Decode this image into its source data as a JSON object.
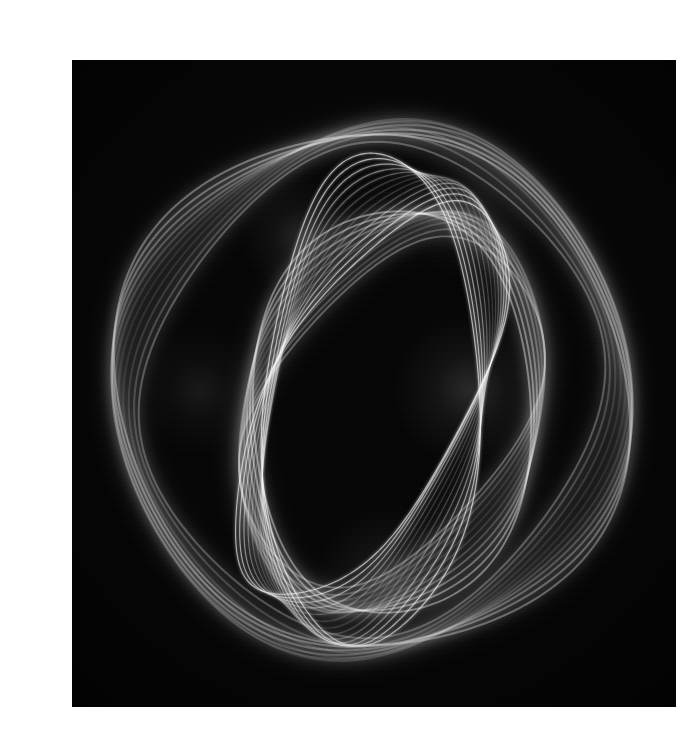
{
  "page": {
    "background_color": "#ffffff",
    "width": 668,
    "height": 735,
    "caption": ""
  },
  "photograph": {
    "title": "",
    "alt_text": "Long-exposure light painting: overlapping luminous loops forming a large outer ring and a smaller inner ring",
    "background_color": "#050505",
    "light_color": "#ffffff",
    "frame": {
      "left": 32,
      "top": 44,
      "width": 604,
      "height": 647
    },
    "subject": "light-trail-spirograph",
    "technique": "long-exposure",
    "stroke_count": "multi-pass",
    "notes": ""
  },
  "chart_data": {
    "type": "line",
    "title": "",
    "xlabel": "",
    "ylabel": "",
    "grid": false,
    "legend": "none",
    "xlim": [
      0,
      604
    ],
    "ylim": [
      0,
      647
    ],
    "families": [
      {
        "name": "outer-ring",
        "center": [
          300,
          330
        ],
        "rx": 252,
        "ry": 272,
        "passes": 11,
        "precession_deg": 3.4,
        "base_rotation_deg": -6,
        "wobble_amp": 17,
        "wobble_freq": 2,
        "stroke_width": 2.1,
        "opacity": 0.36,
        "color": "#ffffff"
      },
      {
        "name": "inner-ring",
        "center": [
          320,
          352
        ],
        "rx": 140,
        "ry": 212,
        "passes": 11,
        "precession_deg": 3.0,
        "base_rotation_deg": 6,
        "wobble_amp": 11,
        "wobble_freq": 2,
        "stroke_width": 1.9,
        "opacity": 0.4,
        "color": "#ffffff"
      },
      {
        "name": "crown-loops",
        "center": [
          300,
          340
        ],
        "rx": 108,
        "ry": 246,
        "passes": 13,
        "precession_deg": 2.3,
        "base_rotation_deg": 2,
        "wobble_amp": 6,
        "wobble_freq": 3,
        "stroke_width": 1.15,
        "opacity": 0.62,
        "color": "#ffffff"
      }
    ],
    "hotspots": [
      {
        "name": "upper-left-crossing",
        "cx": 228,
        "cy": 176,
        "r": 60,
        "intensity": 0.22
      },
      {
        "name": "mid-right-core",
        "cx": 398,
        "cy": 330,
        "r": 78,
        "intensity": 0.26
      },
      {
        "name": "lower-center-knot",
        "cx": 318,
        "cy": 520,
        "r": 76,
        "intensity": 0.24
      },
      {
        "name": "upper-right-arc",
        "cx": 400,
        "cy": 150,
        "r": 70,
        "intensity": 0.16
      },
      {
        "name": "left-band",
        "cx": 128,
        "cy": 330,
        "r": 66,
        "intensity": 0.14
      }
    ]
  }
}
